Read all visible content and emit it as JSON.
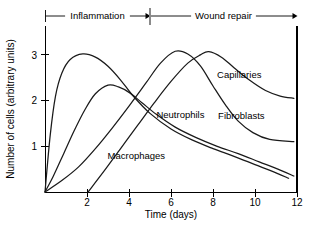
{
  "chart_data": {
    "type": "line",
    "title": "",
    "xlabel": "Time (days)",
    "ylabel": "Number of cells (arbitrary units)",
    "xlim": [
      0,
      12
    ],
    "ylim": [
      0,
      3.6
    ],
    "xticks": [
      2,
      4,
      6,
      8,
      10,
      12
    ],
    "xtick_labels": [
      "2",
      "4",
      "6",
      "8",
      "10",
      "12"
    ],
    "yticks": [
      1,
      2,
      3
    ],
    "ytick_labels": [
      "1",
      "2",
      "3"
    ],
    "grid": false,
    "legend_position": "inline-annotations",
    "series": [
      {
        "name": "Neutrophils",
        "label": "Neutrophils",
        "label_x": 6.45,
        "label_y": 1.63,
        "peak_x": 1.8,
        "peak_y": 3.02,
        "points": [
          [
            0.0,
            0.0
          ],
          [
            0.25,
            1.25
          ],
          [
            0.5,
            2.1
          ],
          [
            0.8,
            2.6
          ],
          [
            1.2,
            2.9
          ],
          [
            1.8,
            3.02
          ],
          [
            2.4,
            2.95
          ],
          [
            3.0,
            2.75
          ],
          [
            3.6,
            2.45
          ],
          [
            4.2,
            2.1
          ],
          [
            5.0,
            1.72
          ],
          [
            6.0,
            1.38
          ],
          [
            7.0,
            1.14
          ],
          [
            8.0,
            0.95
          ],
          [
            9.0,
            0.78
          ],
          [
            10.0,
            0.6
          ],
          [
            11.0,
            0.42
          ],
          [
            11.6,
            0.3
          ]
        ]
      },
      {
        "name": "Macrophages",
        "label": "Macrophages",
        "label_x": 4.35,
        "label_y": 0.72,
        "peak_x": 3.0,
        "peak_y": 2.34,
        "points": [
          [
            0.0,
            0.0
          ],
          [
            0.4,
            0.35
          ],
          [
            0.9,
            0.85
          ],
          [
            1.4,
            1.35
          ],
          [
            1.9,
            1.8
          ],
          [
            2.4,
            2.15
          ],
          [
            3.0,
            2.34
          ],
          [
            3.5,
            2.3
          ],
          [
            4.0,
            2.18
          ],
          [
            4.6,
            1.96
          ],
          [
            5.3,
            1.7
          ],
          [
            6.2,
            1.42
          ],
          [
            7.2,
            1.19
          ],
          [
            8.2,
            1.0
          ],
          [
            9.2,
            0.84
          ],
          [
            10.2,
            0.66
          ],
          [
            11.2,
            0.48
          ],
          [
            11.85,
            0.35
          ]
        ]
      },
      {
        "name": "Fibroblasts",
        "label": "Fibroblasts",
        "label_x": 9.35,
        "label_y": 1.6,
        "peak_x": 6.2,
        "peak_y": 3.08,
        "points": [
          [
            0.0,
            0.0
          ],
          [
            0.8,
            0.25
          ],
          [
            1.6,
            0.55
          ],
          [
            2.4,
            0.95
          ],
          [
            3.2,
            1.4
          ],
          [
            4.0,
            1.88
          ],
          [
            4.8,
            2.38
          ],
          [
            5.5,
            2.82
          ],
          [
            6.2,
            3.08
          ],
          [
            6.8,
            3.02
          ],
          [
            7.4,
            2.76
          ],
          [
            8.0,
            2.32
          ],
          [
            8.6,
            1.9
          ],
          [
            9.2,
            1.55
          ],
          [
            9.9,
            1.3
          ],
          [
            10.7,
            1.15
          ],
          [
            11.85,
            1.1
          ]
        ]
      },
      {
        "name": "Capillaries",
        "label": "Capillaries",
        "label_x": 9.25,
        "label_y": 2.5,
        "peak_x": 7.8,
        "peak_y": 3.07,
        "points": [
          [
            2.05,
            0.0
          ],
          [
            2.8,
            0.45
          ],
          [
            3.6,
            0.95
          ],
          [
            4.4,
            1.45
          ],
          [
            5.2,
            1.95
          ],
          [
            6.0,
            2.42
          ],
          [
            6.8,
            2.82
          ],
          [
            7.4,
            3.0
          ],
          [
            7.8,
            3.07
          ],
          [
            8.4,
            2.95
          ],
          [
            9.0,
            2.72
          ],
          [
            9.7,
            2.46
          ],
          [
            10.5,
            2.22
          ],
          [
            11.2,
            2.1
          ],
          [
            11.85,
            2.05
          ]
        ]
      }
    ],
    "annotations": [
      {
        "name": "inflammation-phase",
        "label": "Inflammation",
        "x_start": 0,
        "x_end": 5,
        "arrow": "right"
      },
      {
        "name": "wound-repair-phase",
        "label": "Wound repair",
        "x_start": 5,
        "x_end": 12,
        "arrow": "right"
      }
    ],
    "phase_divider_x": 5
  }
}
